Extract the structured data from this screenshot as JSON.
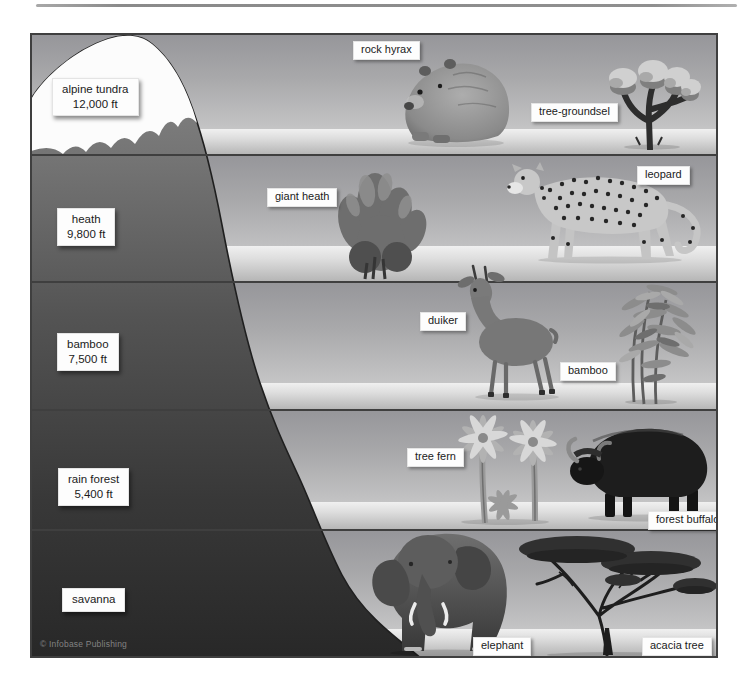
{
  "meta": {
    "copyright": "© Infobase Publishing"
  },
  "zones": [
    {
      "name": "alpine tundra",
      "altitude": "12,000 ft",
      "species": [
        {
          "label": "rock hyrax"
        },
        {
          "label": "tree-groundsel"
        }
      ]
    },
    {
      "name": "heath",
      "altitude": "9,800 ft",
      "species": [
        {
          "label": "giant heath"
        },
        {
          "label": "leopard"
        }
      ]
    },
    {
      "name": "bamboo",
      "altitude": "7,500 ft",
      "species": [
        {
          "label": "duiker"
        },
        {
          "label": "bamboo"
        }
      ]
    },
    {
      "name": "rain forest",
      "altitude": "5,400 ft",
      "species": [
        {
          "label": "tree fern"
        },
        {
          "label": "forest buffalo"
        }
      ]
    },
    {
      "name": "savanna",
      "species": [
        {
          "label": "elephant"
        },
        {
          "label": "acacia tree"
        }
      ]
    }
  ],
  "colors": {
    "sky_top": "#96969a",
    "sky_bottom": "#d6d6d6",
    "ground_light": "#f0f0f0",
    "ground_dark": "#b4b4b4",
    "mountain_top": "#888888",
    "mountain_bottom": "#2a2a2a",
    "snow": "#fcfcfc",
    "boundary_line": "#3f3f3f"
  }
}
